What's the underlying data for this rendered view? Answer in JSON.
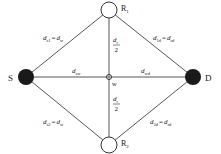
{
  "diagram": {
    "nodes": {
      "source": {
        "label": "S",
        "type": "filled"
      },
      "destination": {
        "label": "D",
        "type": "filled"
      },
      "relay1": {
        "label": "R",
        "sub": "1",
        "type": "hollow"
      },
      "relay2": {
        "label": "R",
        "sub": "2",
        "type": "hollow"
      },
      "midpoint": {
        "label": "w",
        "type": "crosshair"
      }
    },
    "edge_labels": {
      "s_r1": {
        "lhs": "d",
        "lhs_sub": "s1",
        "eq": "=",
        "rhs": "d",
        "rhs_sub": "sr"
      },
      "r1_d": {
        "lhs": "d",
        "lhs_sub": "1d",
        "eq": "=",
        "rhs": "d",
        "rhs_sub": "rd"
      },
      "s_r2": {
        "lhs": "d",
        "lhs_sub": "s2",
        "eq": "=",
        "rhs": "d",
        "rhs_sub": "sr"
      },
      "r2_d": {
        "lhs": "d",
        "lhs_sub": "2d",
        "eq": "=",
        "rhs": "d",
        "rhs_sub": "rd"
      },
      "s_w": {
        "main": "d",
        "sub": "sw"
      },
      "w_d": {
        "main": "d",
        "sub": "wd"
      },
      "w_r1": {
        "num": "d",
        "num_sub": "r",
        "den": "2"
      },
      "w_r2": {
        "num": "d",
        "num_sub": "r",
        "den": "2"
      }
    },
    "colors": {
      "line": "#333333",
      "node_fill": "#1a1a1a",
      "text": "#222222"
    }
  }
}
